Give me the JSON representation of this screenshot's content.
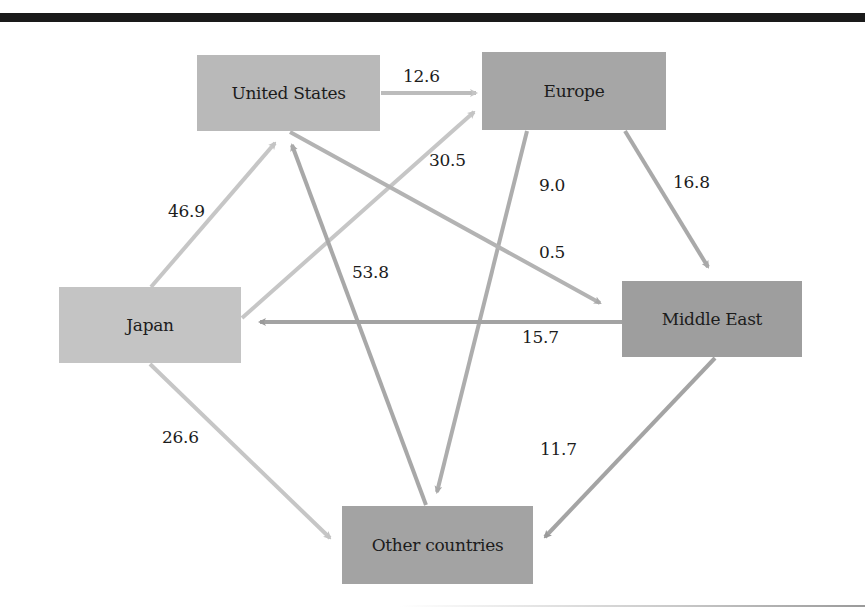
{
  "diagram": {
    "nodes": [
      {
        "id": "us",
        "label": "United States",
        "color": "#b9b9b9"
      },
      {
        "id": "europe",
        "label": "Europe",
        "color": "#a6a6a6"
      },
      {
        "id": "japan",
        "label": "Japan",
        "color": "#c4c4c4"
      },
      {
        "id": "middle_east",
        "label": "Middle East",
        "color": "#9e9e9e"
      },
      {
        "id": "other",
        "label": "Other countries",
        "color": "#a3a3a3"
      }
    ],
    "flows": [
      {
        "from": "United States",
        "to": "Europe",
        "value": "12.6"
      },
      {
        "from": "Japan",
        "to": "Europe",
        "value": "30.5"
      },
      {
        "from": "Japan",
        "to": "United States",
        "value": "46.9"
      },
      {
        "from": "Other countries",
        "to": "United States",
        "value": "53.8"
      },
      {
        "from": "Europe",
        "to": "Other countries",
        "value": "9.0"
      },
      {
        "from": "Europe",
        "to": "Middle East",
        "value": "16.8"
      },
      {
        "from": "United States",
        "to": "Middle East",
        "value": "0.5"
      },
      {
        "from": "Middle East",
        "to": "Japan",
        "value": "15.7"
      },
      {
        "from": "Japan",
        "to": "Other countries",
        "value": "26.6"
      },
      {
        "from": "Middle East",
        "to": "Other countries",
        "value": "11.7"
      }
    ]
  }
}
